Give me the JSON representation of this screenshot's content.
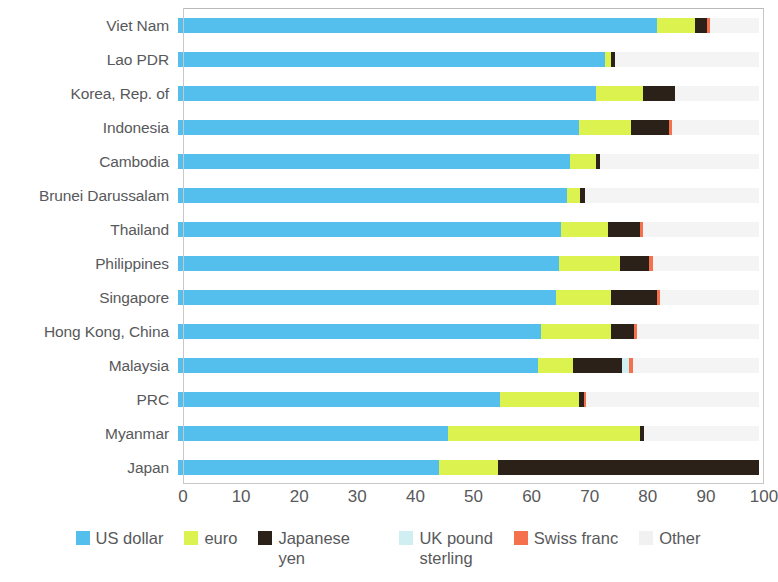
{
  "chart_data": {
    "type": "bar",
    "orientation": "horizontal",
    "stacked": true,
    "normalized_percent": true,
    "title": "",
    "subtitle": "",
    "xlabel": "",
    "ylabel": "",
    "xlim": [
      0,
      100
    ],
    "xticks": [
      0,
      10,
      20,
      30,
      40,
      50,
      60,
      70,
      80,
      90,
      100
    ],
    "xtick_labels": [
      "0",
      "10",
      "20",
      "30",
      "40",
      "50",
      "60",
      "70",
      "80",
      "90",
      "100"
    ],
    "grid": false,
    "legend_position": "bottom",
    "categories": [
      "Viet Nam",
      "Lao PDR",
      "Korea, Rep. of",
      "Indonesia",
      "Cambodia",
      "Brunei Darussalam",
      "Thailand",
      "Philippines",
      "Singapore",
      "Hong Kong, China",
      "Malaysia",
      "PRC",
      "Myanmar",
      "Japan"
    ],
    "series": [
      {
        "name": "US dollar",
        "color": "#54BEEC",
        "values": [
          82.4,
          73.5,
          72.0,
          69.0,
          67.5,
          67.0,
          66.0,
          65.5,
          65.0,
          62.5,
          62.0,
          55.5,
          46.5,
          45.0
        ]
      },
      {
        "name": "euro",
        "color": "#DCF24E",
        "values": [
          6.6,
          1.0,
          8.0,
          9.0,
          4.5,
          2.2,
          8.0,
          10.5,
          9.5,
          12.0,
          6.0,
          13.5,
          33.0,
          10.0
        ]
      },
      {
        "name": "Japanese yen",
        "color": "#2B2118",
        "values": [
          2.0,
          0.8,
          5.5,
          6.5,
          0.6,
          0.8,
          5.5,
          5.0,
          8.0,
          4.0,
          8.5,
          0.8,
          0.7,
          45.0
        ]
      },
      {
        "name": "UK pound sterling",
        "color": "#CFEFF2",
        "values": [
          0.0,
          0.0,
          0.0,
          0.0,
          0.0,
          0.0,
          0.0,
          0.0,
          0.0,
          0.0,
          1.2,
          0.0,
          0.0,
          0.0
        ]
      },
      {
        "name": "Swiss franc",
        "color": "#F5714E",
        "values": [
          0.5,
          0.0,
          0.0,
          0.5,
          0.0,
          0.0,
          0.6,
          0.8,
          0.5,
          0.5,
          0.6,
          0.5,
          0.0,
          0.0
        ]
      },
      {
        "name": "Other",
        "color": "#F4F4F4",
        "values": [
          8.5,
          24.7,
          14.5,
          15.0,
          27.4,
          30.0,
          19.9,
          18.2,
          17.0,
          21.0,
          21.7,
          29.7,
          19.8,
          0.0
        ]
      }
    ]
  },
  "legend": {
    "items": [
      {
        "label": "US dollar",
        "color": "#54BEEC"
      },
      {
        "label": "euro",
        "color": "#DCF24E"
      },
      {
        "label": "Japanese yen",
        "color": "#2B2118"
      },
      {
        "label": "UK pound\nsterling",
        "color": "#CFEFF2"
      },
      {
        "label": "Swiss franc",
        "color": "#F5714E"
      },
      {
        "label": "Other",
        "color": "#F1F1F1"
      }
    ]
  }
}
